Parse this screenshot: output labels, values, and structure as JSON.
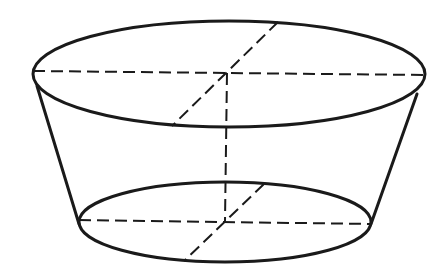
{
  "diagram": {
    "type": "frustum-of-cone",
    "colors": {
      "line": "#1a1a1a",
      "background": "#ffffff"
    },
    "top_base": {
      "cx": 229,
      "cy": 74,
      "rx": 196,
      "ry": 53
    },
    "bottom_base": {
      "cx": 225,
      "cy": 222,
      "rx": 146,
      "ry": 40
    },
    "left_generator": {
      "x1": 37,
      "y1": 86,
      "x2": 79,
      "y2": 224
    },
    "right_generator": {
      "x1": 417,
      "y1": 94,
      "x2": 371,
      "y2": 224
    },
    "top_horizontal_diameter": {
      "x1": 33,
      "y1": 71,
      "x2": 424,
      "y2": 75
    },
    "top_oblique_diameter": {
      "x1": 278,
      "y1": 22,
      "x2": 172,
      "y2": 126
    },
    "bottom_horizontal_diameter": {
      "x1": 79,
      "y1": 220,
      "x2": 371,
      "y2": 224
    },
    "bottom_oblique_diameter": {
      "x1": 264,
      "y1": 184,
      "x2": 184,
      "y2": 261
    },
    "axis": {
      "x1": 227,
      "y1": 73,
      "x2": 225,
      "y2": 221
    }
  }
}
